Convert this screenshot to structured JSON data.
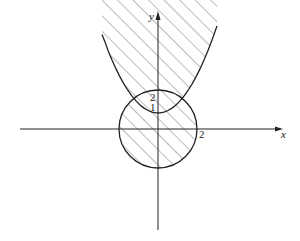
{
  "diagram": {
    "type": "region-plot",
    "axes": {
      "x_label": "x",
      "y_label": "y"
    },
    "labels": {
      "y_tick_2": "2",
      "y_tick_1": "1",
      "x_tick_2": "2"
    },
    "curves": [
      {
        "name": "circle",
        "equation": "x^2 + y^2 = 4",
        "center": [
          0,
          0
        ],
        "radius": 2
      },
      {
        "name": "parabola",
        "equation": "y = x^2 + 1",
        "vertex": [
          0,
          1
        ]
      }
    ],
    "shading": "diagonal hatching",
    "colors": {
      "stroke": "#222222",
      "hatch": "#555555",
      "background": "#ffffff"
    }
  }
}
